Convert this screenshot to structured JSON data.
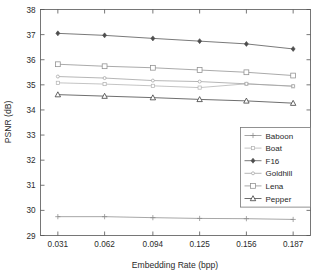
{
  "chart_data": {
    "type": "line",
    "title": "",
    "xlabel": "Embedding Rate (bpp)",
    "ylabel": "PSNR (dB)",
    "x": [
      0.031,
      0.062,
      0.094,
      0.125,
      0.156,
      0.187
    ],
    "xtick_labels": [
      "0.031",
      "0.062",
      "0.094",
      "0.125",
      "0.156",
      "0.187"
    ],
    "ytick_labels": [
      "29",
      "30",
      "31",
      "32",
      "33",
      "34",
      "35",
      "36",
      "37",
      "38"
    ],
    "yticks": [
      29,
      30,
      31,
      32,
      33,
      34,
      35,
      36,
      37,
      38
    ],
    "xlim": [
      0.0195,
      0.1985
    ],
    "ylim": [
      29,
      38
    ],
    "grid": false,
    "legend_position": "lower-right",
    "series": [
      {
        "name": "Baboon",
        "marker": "plus",
        "color": "#8a8a8a",
        "values": [
          29.75,
          29.75,
          29.71,
          29.68,
          29.67,
          29.64
        ]
      },
      {
        "name": "Boat",
        "marker": "square-open-small",
        "color": "#b0b0b0",
        "values": [
          35.08,
          35.03,
          34.96,
          34.89,
          35.04,
          34.94
        ]
      },
      {
        "name": "F16",
        "marker": "diamond-filled",
        "color": "#4d4d4d",
        "values": [
          37.05,
          36.97,
          36.85,
          36.74,
          36.63,
          36.43
        ]
      },
      {
        "name": "Goldhill",
        "marker": "dot",
        "color": "#9e9e9e",
        "values": [
          35.33,
          35.27,
          35.17,
          35.13,
          35.04,
          34.95
        ]
      },
      {
        "name": "Lena",
        "marker": "square-open",
        "color": "#8d8d8d",
        "values": [
          35.82,
          35.74,
          35.68,
          35.59,
          35.5,
          35.37
        ]
      },
      {
        "name": "Pepper",
        "marker": "triangle-open",
        "color": "#3f3f3f",
        "values": [
          34.61,
          34.55,
          34.49,
          34.42,
          34.36,
          34.27
        ]
      }
    ]
  },
  "legend": {
    "entries": [
      {
        "label": "Baboon"
      },
      {
        "label": "Boat"
      },
      {
        "label": "F16"
      },
      {
        "label": "Goldhill"
      },
      {
        "label": "Lena"
      },
      {
        "label": "Pepper"
      }
    ]
  }
}
